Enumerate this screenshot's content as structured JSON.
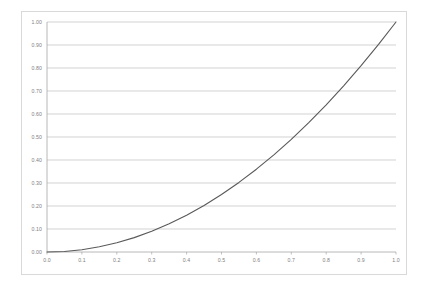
{
  "chart_data": {
    "type": "line",
    "title": "",
    "subtitle": "",
    "xlabel": "",
    "ylabel": "",
    "xlim": [
      0.0,
      1.0
    ],
    "ylim": [
      0.0,
      1.0
    ],
    "grid": "horizontal",
    "legend": "none",
    "series": [
      {
        "name": "y = x^2",
        "color": "#595959",
        "x": [
          0.0,
          0.05,
          0.1,
          0.15,
          0.2,
          0.25,
          0.3,
          0.35,
          0.4,
          0.45,
          0.5,
          0.55,
          0.6,
          0.65,
          0.7,
          0.75,
          0.8,
          0.85,
          0.9,
          0.95,
          1.0
        ],
        "values": [
          0.0,
          0.0025,
          0.01,
          0.0225,
          0.04,
          0.0625,
          0.09,
          0.1225,
          0.16,
          0.2025,
          0.25,
          0.3025,
          0.36,
          0.4225,
          0.49,
          0.5625,
          0.64,
          0.7225,
          0.81,
          0.9025,
          1.0
        ]
      }
    ],
    "x_ticks": [
      {
        "value": 0.0,
        "label": "0.0"
      },
      {
        "value": 0.1,
        "label": "0.1"
      },
      {
        "value": 0.2,
        "label": "0.2"
      },
      {
        "value": 0.3,
        "label": "0.3"
      },
      {
        "value": 0.4,
        "label": "0.4"
      },
      {
        "value": 0.5,
        "label": "0.5"
      },
      {
        "value": 0.6,
        "label": "0.6"
      },
      {
        "value": 0.7,
        "label": "0.7"
      },
      {
        "value": 0.8,
        "label": "0.8"
      },
      {
        "value": 0.9,
        "label": "0.9"
      },
      {
        "value": 1.0,
        "label": "1.0"
      }
    ],
    "y_ticks": [
      {
        "value": 1.0,
        "label": "1.00"
      },
      {
        "value": 0.9,
        "label": "0.90"
      },
      {
        "value": 0.8,
        "label": "0.80"
      },
      {
        "value": 0.7,
        "label": "0.70"
      },
      {
        "value": 0.6,
        "label": "0.60"
      },
      {
        "value": 0.5,
        "label": "0.50"
      },
      {
        "value": 0.4,
        "label": "0.40"
      },
      {
        "value": 0.3,
        "label": "0.30"
      },
      {
        "value": 0.2,
        "label": "0.20"
      },
      {
        "value": 0.1,
        "label": "0.10"
      },
      {
        "value": 0.0,
        "label": "0.00"
      }
    ]
  },
  "style": {
    "gridline_color": "#bfbfbf",
    "axis_color": "#a6a6a6",
    "frame_color": "#d9d9d9",
    "tick_text_color": "#808080",
    "plot_background": "#ffffff",
    "curve_color": "#595959"
  },
  "geometry": {
    "plot_left": 47,
    "plot_right": 396,
    "plot_top": 22,
    "plot_bottom": 252
  }
}
